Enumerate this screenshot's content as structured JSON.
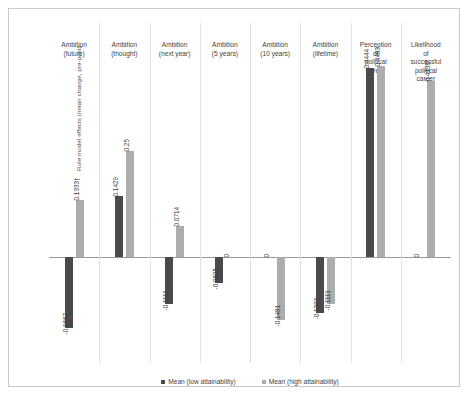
{
  "chart_data": {
    "type": "bar",
    "title": "",
    "subtitle": "",
    "xlabel": "",
    "ylabel": "Role model effects (mean change, pre-post)",
    "ylim": [
      -0.25,
      0.55
    ],
    "grid": false,
    "legend_position": "bottom",
    "zero_line": true,
    "categories": [
      "Ambition\n(future)",
      "Ambition\n(thought)",
      "Ambition\n(next year)",
      "Ambition\n(5 years)",
      "Ambition\n(10 years)",
      "Ambition\n(lifetime)",
      "Perception\nof\npolitical\ncareer",
      "Likelihood\nof\nsuccessful\npolitical\ncareer"
    ],
    "series": [
      {
        "name": "Mean (low attainability)",
        "color": "#4a4a4a",
        "values": [
          -0.1667,
          0.1429,
          -0.1111,
          -0.0625,
          0,
          -0.1333,
          0.4444,
          0
        ],
        "labels": [
          "-0.1667",
          "0.1429",
          "-0.1111",
          "-0.0625",
          "0",
          "-0.1333",
          "0.4444",
          "0"
        ]
      },
      {
        "name": "Mean (high attainability)",
        "color": "#adadad",
        "values": [
          0.1333,
          0.25,
          0.0714,
          0,
          -0.1481,
          -0.1111,
          0.4483,
          0.4138
        ],
        "labels": [
          "0.1333†",
          "0.25",
          "0.0714",
          "0",
          "-0.1481",
          "-0.1111",
          "0.4483",
          "0.4138*"
        ]
      }
    ]
  },
  "legend": {
    "items": [
      {
        "label": "Mean (low attainability)",
        "swatch": "low"
      },
      {
        "label": "Mean (high attainability)",
        "swatch": "high"
      }
    ]
  },
  "colors": {
    "low_attainability": "#4a4a4a",
    "high_attainability": "#adadad",
    "axis": "#9a9a9a",
    "divider": "#e2e2e2",
    "border": "#c9c9c9",
    "text": "#3f3f3f"
  }
}
